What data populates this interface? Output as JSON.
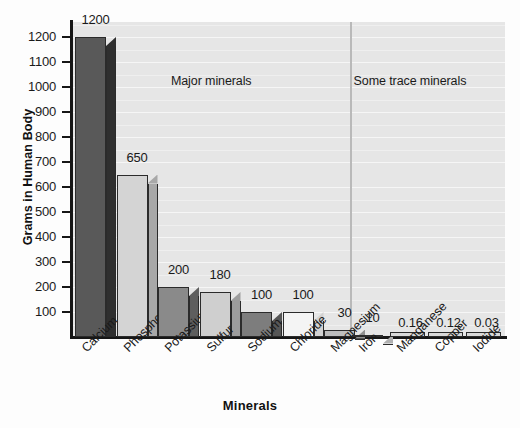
{
  "chart_data": {
    "type": "bar",
    "title": "",
    "xlabel": "Minerals",
    "ylabel": "Grams in Human Body",
    "categories": [
      "Calcium",
      "Phosphorus",
      "Potassium",
      "Sulfur",
      "Sodium",
      "Chloride",
      "Magnesium",
      "Iron",
      "Manganese",
      "Copper",
      "Iodide"
    ],
    "values": [
      1200,
      650,
      200,
      180,
      100,
      100,
      30,
      10,
      0.16,
      0.12,
      0.03
    ],
    "value_labels": [
      "1200",
      "650",
      "200",
      "180",
      "100",
      "100",
      "30",
      "10",
      "0.16",
      "0.12",
      "0.03"
    ],
    "ylim": [
      0,
      1260
    ],
    "y_ticks": [
      100,
      200,
      300,
      400,
      500,
      600,
      700,
      800,
      900,
      1000,
      1100,
      1200
    ],
    "y_tick_labels": [
      "100",
      "200",
      "300",
      "400",
      "500",
      "600",
      "700",
      "800",
      "900",
      "1000",
      "1100",
      "1200"
    ],
    "grid": true,
    "legend": "none",
    "annotations": [
      {
        "text": "Major minerals",
        "x_fraction": 0.32,
        "y_value": 1020
      },
      {
        "text": "Some trace minerals",
        "x_fraction": 0.78,
        "y_value": 1020
      }
    ],
    "bar_colors": [
      "#595959",
      "#d4d4d4",
      "#8a8a8a",
      "#cfcfcf",
      "#7d7d7d",
      "#f4f4f4",
      "#bdbdbd",
      "#d9d9d9",
      "#d9d9d9",
      "#d9d9d9",
      "#d9d9d9"
    ],
    "bar_side_colors": [
      "#2f2f2f",
      "#a8a8a8",
      "#5e5e5e",
      "#9d9d9d",
      "#565656",
      "#d2d2d2",
      "#909090",
      "#b0b0b0",
      "#b0b0b0",
      "#b0b0b0",
      "#b0b0b0"
    ],
    "plot_background": "#e6e6e6",
    "gridline_color": "#f6f6f6",
    "axis_color": "#161616",
    "divider_color": "#b9b9b9"
  }
}
